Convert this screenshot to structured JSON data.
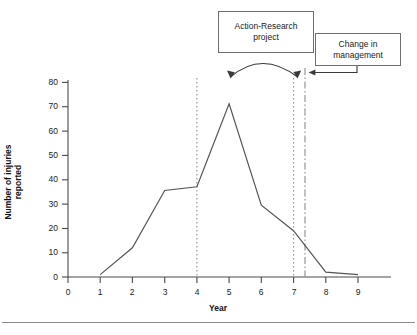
{
  "chart_data": {
    "type": "line",
    "title": "",
    "subtitle": "",
    "xlabel": "Year",
    "ylabel": "Number of injuries reported",
    "x": [
      1,
      2,
      3,
      4,
      5,
      6,
      7,
      8,
      9
    ],
    "values": [
      1,
      12,
      35.5,
      37,
      71,
      29.5,
      19,
      2,
      1
    ],
    "series": [
      {
        "name": "Number of injuries reported",
        "values": [
          1,
          12,
          35.5,
          37,
          71,
          29.5,
          19,
          2,
          1
        ]
      }
    ],
    "xlim": [
      0,
      9.8
    ],
    "ylim": [
      0,
      80
    ],
    "xticks": [
      "0",
      "1",
      "2",
      "3",
      "4",
      "5",
      "6",
      "7",
      "8",
      "9"
    ],
    "yticks": [
      "0",
      "10",
      "20",
      "30",
      "40",
      "50",
      "60",
      "70",
      "80"
    ],
    "grid": false,
    "legend": false,
    "legend_position": "none",
    "line_color": "#555555",
    "annotations": [
      {
        "label": "Action-Research\nproject",
        "kind": "callout-box",
        "span_start_x": 5,
        "span_end_x": 7,
        "marker": "double-headed-curved-arrow",
        "guide_lines": [
          "dotted at x=5",
          "dotted at x=7"
        ]
      },
      {
        "label": "Change in\nmanagement",
        "kind": "callout-box",
        "points_to_x": 7.35,
        "marker": "arrow",
        "guide_lines": [
          "dash-dot at x=7.35"
        ]
      }
    ]
  },
  "chart": {
    "xlabel": "Year",
    "ylabel": "Number of injuries reported",
    "xticks": [
      "0",
      "1",
      "2",
      "3",
      "4",
      "5",
      "6",
      "7",
      "8",
      "9"
    ],
    "yticks": [
      "80",
      "70",
      "60",
      "50",
      "40",
      "30",
      "20",
      "10",
      "0"
    ]
  },
  "callouts": {
    "action_research": "Action-Research\nproject",
    "change_management": "Change in\nmanagement"
  },
  "colors": {
    "data_line": "#555555",
    "axis": "#4a4a4a",
    "box_border": "#6e6e6e",
    "guide_dotted": "#8c8c8c",
    "guide_dashdot": "#8c8c8c",
    "rule": "#8a8a8a",
    "text": "#1a1a1a"
  }
}
